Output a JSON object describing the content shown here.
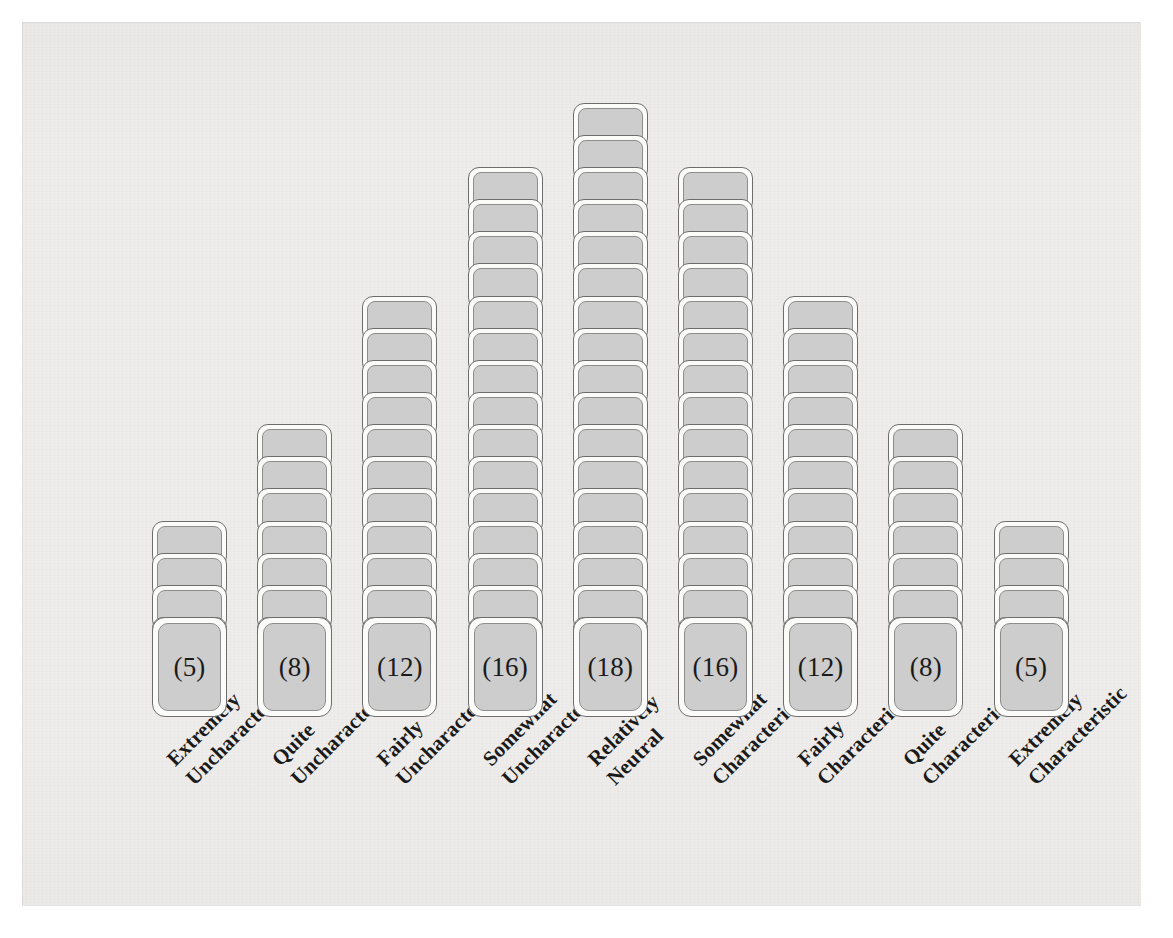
{
  "figure": {
    "background_color": "#eeedeb",
    "card_fill_color": "#cdcdcd",
    "card_border_color": "#6d6d6d",
    "text_color": "#1a1a1a"
  },
  "chart_data": {
    "type": "bar",
    "title": "",
    "xlabel": "",
    "ylabel": "",
    "grid": false,
    "legend": null,
    "categories": [
      "Extremely Uncharacteristic",
      "Quite Uncharacteristic",
      "Fairly Uncharacteristic",
      "Somewhat Uncharacteristic",
      "Relatively Neutral",
      "Somewhat Characteristic",
      "Fairly Characteristic",
      "Quite Characteristic",
      "Extremely Characteristic"
    ],
    "values": [
      5,
      8,
      12,
      16,
      18,
      16,
      12,
      8,
      5
    ],
    "value_labels": [
      "(5)",
      "(8)",
      "(12)",
      "(16)",
      "(18)",
      "(16)",
      "(12)",
      "(8)",
      "(5)"
    ],
    "total": 100,
    "ylim": [
      0,
      18
    ],
    "unit": "cards"
  },
  "columns": [
    {
      "id": "col-1",
      "value": 5,
      "value_label": "(5)",
      "label_line1": "Extremely",
      "label_line2": "Uncharacteristic"
    },
    {
      "id": "col-2",
      "value": 8,
      "value_label": "(8)",
      "label_line1": "Quite",
      "label_line2": "Uncharacteristic"
    },
    {
      "id": "col-3",
      "value": 12,
      "value_label": "(12)",
      "label_line1": "Fairly",
      "label_line2": "Uncharacteristic"
    },
    {
      "id": "col-4",
      "value": 16,
      "value_label": "(16)",
      "label_line1": "Somewhat",
      "label_line2": "Uncharacteristic"
    },
    {
      "id": "col-5",
      "value": 18,
      "value_label": "(18)",
      "label_line1": "Relatively",
      "label_line2": "Neutral"
    },
    {
      "id": "col-6",
      "value": 16,
      "value_label": "(16)",
      "label_line1": "Somewhat",
      "label_line2": "Characteristic"
    },
    {
      "id": "col-7",
      "value": 12,
      "value_label": "(12)",
      "label_line1": "Fairly",
      "label_line2": "Characteristic"
    },
    {
      "id": "col-8",
      "value": 8,
      "value_label": "(8)",
      "label_line1": "Quite",
      "label_line2": "Characteristic"
    },
    {
      "id": "col-9",
      "value": 5,
      "value_label": "(5)",
      "label_line1": "Extremely",
      "label_line2": "Characteristic"
    }
  ]
}
